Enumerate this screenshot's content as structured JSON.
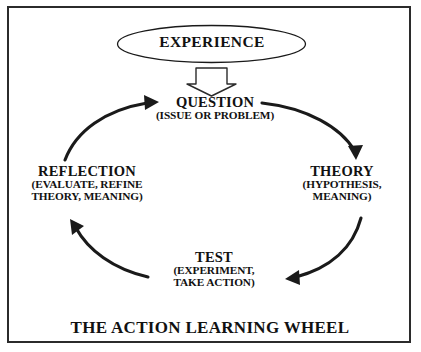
{
  "diagram": {
    "title": "THE ACTION LEARNING WHEEL",
    "source_node": {
      "label": "EXPERIENCE",
      "shape": "ellipse"
    },
    "feed_arrow": {
      "name": "block-arrow-down",
      "from": "EXPERIENCE",
      "to": "QUESTION",
      "style": "hollow-outline"
    },
    "nodes": [
      {
        "id": "question",
        "title": "QUESTION",
        "sub_lines": [
          "(ISSUE OR PROBLEM)"
        ],
        "position": "top"
      },
      {
        "id": "theory",
        "title": "THEORY",
        "sub_lines": [
          "(HYPOTHESIS,",
          "MEANING)"
        ],
        "position": "right"
      },
      {
        "id": "test",
        "title": "TEST",
        "sub_lines": [
          "(EXPERIMENT,",
          "TAKE ACTION)"
        ],
        "position": "bottom"
      },
      {
        "id": "reflection",
        "title": "REFLECTION",
        "sub_lines": [
          "(EVALUATE, REFINE",
          "THEORY, MEANING)"
        ],
        "position": "left"
      }
    ],
    "flow": [
      {
        "from": "QUESTION",
        "to": "THEORY"
      },
      {
        "from": "THEORY",
        "to": "TEST"
      },
      {
        "from": "TEST",
        "to": "REFLECTION"
      },
      {
        "from": "REFLECTION",
        "to": "QUESTION"
      }
    ],
    "direction": "clockwise",
    "colors": {
      "background": "#ffffff",
      "ink": "#111111",
      "border": "#2b2b2b",
      "arrow": "#1a1a1a"
    }
  }
}
